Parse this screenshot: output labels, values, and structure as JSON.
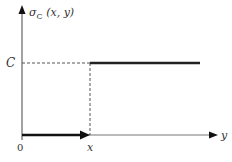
{
  "diagram": {
    "type": "step-function",
    "y_axis_label_symbol": "σ",
    "y_axis_label_subscript": "C",
    "y_axis_label_args": " (x, y)",
    "x_axis_label": "y",
    "level_label": "C",
    "origin_label": "0",
    "step_label": "x",
    "colors": {
      "axis": "#555555",
      "step_line": "#222222",
      "arrow": "#111111",
      "dashed": "#555555"
    }
  }
}
